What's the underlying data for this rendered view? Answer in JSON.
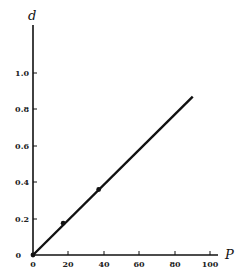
{
  "chart_data": {
    "type": "line",
    "title": "",
    "xlabel": "P",
    "ylabel": "d",
    "xlim": [
      0,
      105
    ],
    "ylim": [
      0,
      1.25
    ],
    "x_ticks": [
      "0",
      "20",
      "40",
      "60",
      "80",
      "100"
    ],
    "y_ticks": [
      "0",
      "0.2",
      "0.4",
      "0.6",
      "0.8",
      "1.0"
    ],
    "grid": false,
    "legend": null,
    "series": [
      {
        "name": "fit line",
        "style": "line",
        "x": [
          0,
          90
        ],
        "y": [
          0,
          0.87
        ]
      },
      {
        "name": "measured points",
        "style": "markers",
        "x": [
          0,
          17,
          37
        ],
        "y": [
          0,
          0.175,
          0.36
        ]
      }
    ]
  }
}
